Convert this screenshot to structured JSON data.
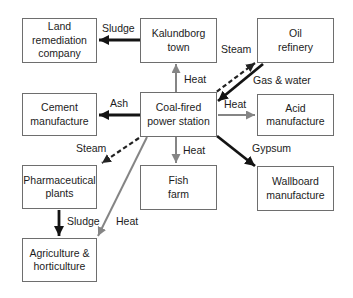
{
  "colors": {
    "background": "#ffffff",
    "box_fill": "#ffffff",
    "box_border": "#6e6e6e",
    "text": "#1c1c1c",
    "solid_arrow": "#141414",
    "gray_arrow": "#858585",
    "dashed_arrow": "#222222"
  },
  "nodes": [
    {
      "id": "land-remediation-company",
      "label": "Land\nremediation\ncompany"
    },
    {
      "id": "kalundborg-town",
      "label": "Kalundborg\ntown"
    },
    {
      "id": "oil-refinery",
      "label": "Oil\nrefinery"
    },
    {
      "id": "cement-manufacture",
      "label": "Cement\nmanufacture"
    },
    {
      "id": "coal-fired-power-station",
      "label": "Coal-fired\npower station"
    },
    {
      "id": "acid-manufacture",
      "label": "Acid\nmanufacture"
    },
    {
      "id": "pharmaceutical-plants",
      "label": "Pharmaceutical\nplants"
    },
    {
      "id": "fish-farm",
      "label": "Fish\nfarm"
    },
    {
      "id": "wallboard-manufacture",
      "label": "Wallboard\nmanufacture"
    },
    {
      "id": "agriculture-horticulture",
      "label": "Agriculture &\nhorticulture"
    }
  ],
  "flows": [
    {
      "label": "Sludge",
      "from": "Kalundborg town",
      "to": "Land remediation company",
      "style": "solid-black"
    },
    {
      "label": "Heat",
      "from": "Coal-fired power station",
      "to": "Kalundborg town",
      "style": "solid-gray"
    },
    {
      "label": "Steam",
      "from": "Coal-fired power station",
      "to": "Oil refinery",
      "style": "dashed-black"
    },
    {
      "label": "Gas & water",
      "from": "Oil refinery",
      "to": "Coal-fired power station",
      "style": "solid-black"
    },
    {
      "label": "Ash",
      "from": "Coal-fired power station",
      "to": "Cement manufacture",
      "style": "solid-black"
    },
    {
      "label": "Heat",
      "from": "Coal-fired power station",
      "to": "Acid manufacture",
      "style": "solid-gray"
    },
    {
      "label": "Steam",
      "from": "Coal-fired power station",
      "to": "Pharmaceutical plants",
      "style": "dashed-black"
    },
    {
      "label": "Heat",
      "from": "Coal-fired power station",
      "to": "Fish farm",
      "style": "solid-gray"
    },
    {
      "label": "Gypsum",
      "from": "Coal-fired power station",
      "to": "Wallboard manufacture",
      "style": "solid-black"
    },
    {
      "label": "Sludge",
      "from": "Pharmaceutical plants",
      "to": "Agriculture & horticulture",
      "style": "solid-black"
    },
    {
      "label": "Heat",
      "from": "Coal-fired power station",
      "to": "Agriculture & horticulture",
      "style": "solid-gray"
    }
  ]
}
